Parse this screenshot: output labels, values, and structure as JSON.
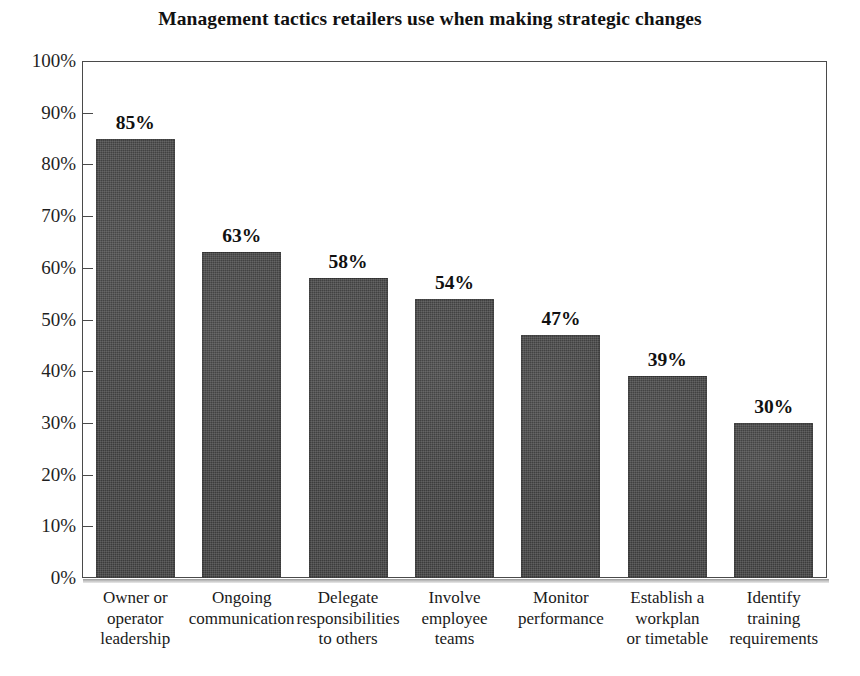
{
  "chart_data": {
    "type": "bar",
    "title": "Management tactics retailers use when making strategic changes",
    "xlabel": "",
    "ylabel": "",
    "ylim": [
      0,
      100
    ],
    "grid": false,
    "legend": null,
    "value_label_suffix": "%",
    "axis_tick_suffix": "%",
    "y_ticks": [
      0,
      10,
      20,
      30,
      40,
      50,
      60,
      70,
      80,
      90,
      100
    ],
    "y_tick_labels": [
      "0%",
      "10%",
      "20%",
      "30%",
      "40%",
      "50%",
      "60%",
      "70%",
      "80%",
      "90%",
      "100%"
    ],
    "categories": [
      "Owner or operator leadership",
      "Ongoing communication",
      "Delegate responsibilities to others",
      "Involve employee teams",
      "Monitor performance",
      "Establish a workplan or timetable",
      "Identify training requirements"
    ],
    "category_label_lines": [
      [
        "Owner or",
        "operator",
        "leadership"
      ],
      [
        "Ongoing",
        "communication"
      ],
      [
        "Delegate",
        "responsibilities",
        "to others"
      ],
      [
        "Involve",
        "employee",
        "teams"
      ],
      [
        "Monitor",
        "performance"
      ],
      [
        "Establish a",
        "workplan",
        "or timetable"
      ],
      [
        "Identify",
        "training",
        "requirements"
      ]
    ],
    "values": [
      85,
      63,
      58,
      54,
      47,
      39,
      30
    ],
    "value_labels": [
      "85%",
      "63%",
      "58%",
      "54%",
      "47%",
      "39%",
      "30%"
    ],
    "colors": {
      "bar_fill": "#3c3c3c",
      "background": "#ffffff",
      "axis": "#4a4a4a",
      "text": "#111111"
    }
  }
}
